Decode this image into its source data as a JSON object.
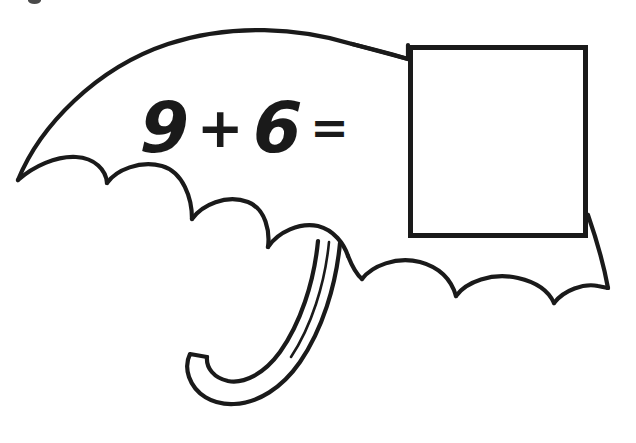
{
  "page": {
    "background_color": "#ffffff",
    "ink_color": "#1a1a1a",
    "width": 636,
    "height": 443
  },
  "artwork": {
    "subject": "umbrella",
    "style": "black-and-white line drawing / coloring-page clip art",
    "description": "Open umbrella seen from the side with a scalloped canopy and a J-shaped curved handle",
    "stroke_color": "#1a1a1a",
    "fill_color": "#ffffff",
    "canopy_scallops_left": 3,
    "canopy_scallops_right": 3,
    "handle_shape": "J-hook",
    "canopy_label": "umbrella-canopy",
    "handle_label": "umbrella-handle"
  },
  "problem": {
    "type": "addition",
    "first_addend": "9",
    "operator": "+",
    "second_addend": "6",
    "equals": "=",
    "answer_value": "",
    "answer_placeholder": "",
    "answer_box_label": "answer-box",
    "full_text": "9 + 6 ="
  },
  "artifacts": {
    "scan_speck": "scan-speck"
  }
}
